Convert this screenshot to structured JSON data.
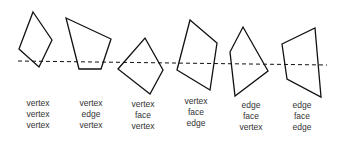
{
  "diagram": {
    "colors": {
      "stroke": "#111111",
      "text": "#333333",
      "background": "#ffffff"
    },
    "line": {
      "style": "dashed",
      "x1": 18,
      "y1": 61,
      "x2": 327,
      "y2": 65
    },
    "shapes": [
      {
        "id": 1,
        "points": "33,12 52,40 39,67 19,49",
        "labels": [
          "vertex",
          "vertex",
          "vertex"
        ],
        "label_x": 8,
        "label_y": 98
      },
      {
        "id": 2,
        "points": "66,18 111,39 101,69 79,69",
        "labels": [
          "vertex",
          "edge",
          "vertex"
        ],
        "label_x": 61,
        "label_y": 98
      },
      {
        "id": 3,
        "points": "145,38 163,70 150,94 118,69",
        "labels": [
          "vertex",
          "face",
          "vertex"
        ],
        "label_x": 113,
        "label_y": 99
      },
      {
        "id": 4,
        "points": "190,20 217,43 210,90 177,70",
        "labels": [
          "vertex",
          "face",
          "edge"
        ],
        "label_x": 166,
        "label_y": 96
      },
      {
        "id": 5,
        "points": "243,27 268,71 235,96 230,52",
        "labels": [
          "edge",
          "face",
          "vertex"
        ],
        "label_x": 221,
        "label_y": 100
      },
      {
        "id": 6,
        "points": "282,44 315,28 321,97 287,79",
        "labels": [
          "edge",
          "face",
          "edge"
        ],
        "label_x": 272,
        "label_y": 100
      }
    ]
  }
}
